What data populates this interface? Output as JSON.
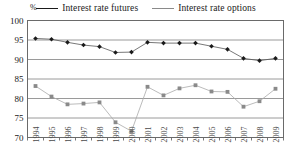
{
  "legend": {
    "items": [
      {
        "label": "Interest rate futures",
        "color": "#1a1a1a",
        "swatch": "legend-line-futures"
      },
      {
        "label": "Interest rate options",
        "color": "#8a8a8a",
        "swatch": "legend-line-options"
      }
    ]
  },
  "axis": {
    "unit": "%"
  },
  "chart_data": {
    "type": "line",
    "title": "",
    "subtitle": "",
    "xlabel": "",
    "ylabel": "%",
    "ylim": [
      70,
      100
    ],
    "yticks": [
      70,
      75,
      80,
      85,
      90,
      95,
      100
    ],
    "grid": "horizontal",
    "legend_position": "top-center",
    "categories": [
      "1994",
      "1995",
      "1996",
      "1997",
      "1998",
      "1999",
      "2000",
      "2001",
      "2002",
      "2003",
      "2004",
      "2005",
      "2006",
      "2007",
      "2008",
      "2009"
    ],
    "series": [
      {
        "name": "Interest rate futures",
        "color": "#1a1a1a",
        "marker": "diamond",
        "values": [
          95.4,
          95.2,
          94.4,
          93.7,
          93.3,
          91.8,
          91.9,
          94.4,
          94.2,
          94.2,
          94.2,
          93.4,
          92.6,
          90.3,
          89.7,
          90.3
        ]
      },
      {
        "name": "Interest rate options",
        "color": "#8a8a8a",
        "marker": "square",
        "values": [
          83.2,
          80.5,
          78.5,
          78.7,
          79.0,
          73.9,
          71.6,
          83.0,
          80.8,
          82.6,
          83.4,
          81.8,
          81.7,
          77.9,
          79.3,
          82.5
        ]
      }
    ]
  }
}
